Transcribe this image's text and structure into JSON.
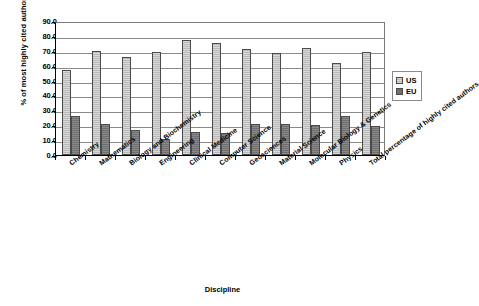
{
  "chart_data": {
    "type": "bar",
    "title": "",
    "xlabel": "Discipline",
    "ylabel": "% of most highly cited authors",
    "ylim": [
      0,
      90
    ],
    "ytick_step": 10,
    "grid": true,
    "legend_position": "right",
    "ytick_labels": [
      "90.0",
      "80.0",
      "70.0",
      "60.0",
      "50.0",
      "40.0",
      "30.0",
      "20.0",
      "10.0",
      "0.0"
    ],
    "categories": [
      "Chemistry",
      "Mathematics",
      "Biology and Biochemistry",
      "Engineering",
      "Clinical Medicine",
      "Computer Science",
      "Geosciences",
      "Material Science",
      "Molecular Biology & Genetics",
      "Physics",
      "Total percentage of highly cited authors"
    ],
    "series": [
      {
        "name": "US",
        "color": "#b9b9b9",
        "values": [
          57.0,
          70.0,
          65.5,
          69.5,
          77.0,
          75.0,
          71.5,
          68.5,
          72.0,
          62.0,
          69.5
        ]
      },
      {
        "name": "EU",
        "color": "#6f6f6f",
        "values": [
          26.0,
          21.0,
          17.0,
          11.0,
          15.5,
          14.5,
          20.5,
          20.5,
          20.0,
          26.0,
          19.5
        ]
      }
    ]
  },
  "legend": {
    "items": [
      {
        "label": "US",
        "swatch": "us"
      },
      {
        "label": "EU",
        "swatch": "eu"
      }
    ]
  }
}
